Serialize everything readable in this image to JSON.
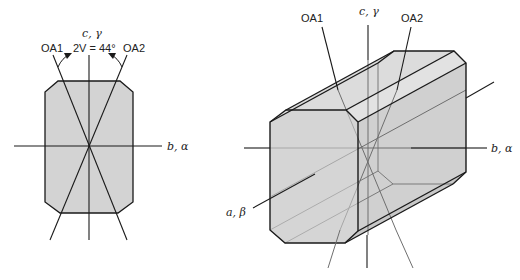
{
  "left_figure": {
    "title": "Section view (a-axis projection)",
    "labels": {
      "c_axis": "c, γ",
      "oa1": "OA1",
      "oa2": "OA2",
      "angle": "2V = 44°",
      "b_axis": "b, α"
    },
    "fill_color": "#d3d3d3"
  },
  "right_figure": {
    "labels": {
      "oa1": "OA1",
      "c_axis": "c, γ",
      "oa2": "OA2",
      "b_axis": "b, α",
      "a_axis": "a, β"
    },
    "fill_color": "#d6d6d6"
  }
}
